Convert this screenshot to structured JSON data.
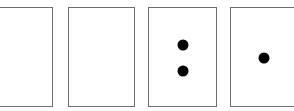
{
  "diagram": {
    "border_color": "#6e6e6e",
    "dot_color": "#000000",
    "cards": [
      {
        "id": "card-1",
        "x": -1,
        "y": 7,
        "w": 54,
        "h": 100,
        "dots": []
      },
      {
        "id": "card-2",
        "x": 68,
        "y": 7,
        "w": 67,
        "h": 100,
        "dots": []
      },
      {
        "id": "card-3",
        "x": 148,
        "y": 7,
        "w": 69,
        "h": 100,
        "dots": [
          {
            "cx": 34,
            "cy": 37
          },
          {
            "cx": 34,
            "cy": 63
          }
        ]
      },
      {
        "id": "card-4",
        "x": 230,
        "y": 7,
        "w": 66,
        "h": 100,
        "dots": [
          {
            "cx": 33,
            "cy": 50
          }
        ]
      }
    ],
    "dot_counts": [
      0,
      0,
      2,
      1
    ]
  }
}
